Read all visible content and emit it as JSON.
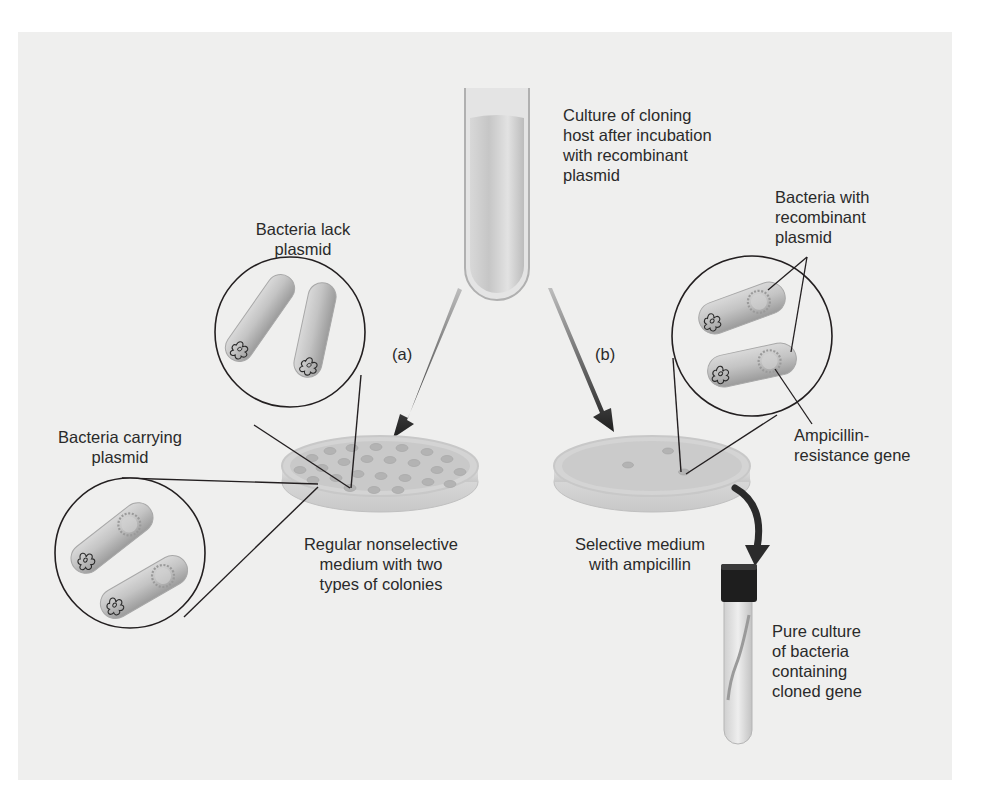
{
  "diagram": {
    "type": "process-diagram",
    "colors": {
      "background_panel": "#efefee",
      "outline": "#231f20",
      "bacteria_fill": "#bdbdbd",
      "arrow": "#2b2b2b",
      "cap": "#1e1e1e"
    },
    "labels": {
      "culture_tube": "Culture of cloning\nhost after incubation\nwith recombinant\nplasmid",
      "lack_plasmid": "Bacteria lack\nplasmid",
      "carrying_plasmid": "Bacteria carrying\nplasmid",
      "recombinant_plasmid": "Bacteria with\nrecombinant\nplasmid",
      "amp_gene": "Ampicillin-\nresistance gene",
      "nonselective_medium": "Regular nonselective\nmedium with two\ntypes of colonies",
      "selective_medium": "Selective medium\nwith ampicillin",
      "pure_culture": "Pure culture\nof bacteria\ncontaining\ncloned gene",
      "path_a": "(a)",
      "path_b": "(b)"
    },
    "nodes": [
      {
        "id": "culture_tube",
        "kind": "test-tube"
      },
      {
        "id": "dish_a",
        "kind": "petri-dish",
        "colonies": "many"
      },
      {
        "id": "dish_b",
        "kind": "petri-dish",
        "colonies": 3
      },
      {
        "id": "pure_culture_tube",
        "kind": "capped-test-tube"
      },
      {
        "id": "zoom_lack_plasmid",
        "kind": "magnified-circle",
        "bacteria": 2,
        "plasmid": false
      },
      {
        "id": "zoom_carrying_plasmid",
        "kind": "magnified-circle",
        "bacteria": 2,
        "plasmid": true
      },
      {
        "id": "zoom_recombinant",
        "kind": "magnified-circle",
        "bacteria": 2,
        "plasmid": true
      }
    ],
    "edges": [
      {
        "from": "culture_tube",
        "to": "dish_a",
        "label": "(a)"
      },
      {
        "from": "culture_tube",
        "to": "dish_b",
        "label": "(b)"
      },
      {
        "from": "dish_b",
        "to": "pure_culture_tube"
      }
    ]
  }
}
